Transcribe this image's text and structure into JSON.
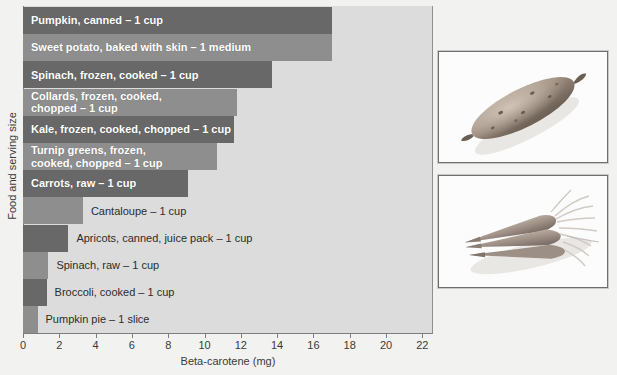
{
  "chart_data": {
    "type": "bar",
    "orientation": "horizontal",
    "title": "",
    "xlabel": "Beta-carotene (mg)",
    "ylabel": "Food and serving size",
    "xlim": [
      0,
      22.5
    ],
    "xticks": [
      0,
      2,
      4,
      6,
      8,
      10,
      12,
      14,
      16,
      18,
      20,
      22
    ],
    "xtick_labels": [
      "0",
      "2",
      "4",
      "6",
      "8",
      "10",
      "12",
      "14",
      "16",
      "18",
      "20",
      "22"
    ],
    "grid": false,
    "legend": false,
    "categories": [
      "Pumpkin, canned – 1 cup",
      "Sweet potato, baked with skin – 1 medium",
      "Spinach, frozen, cooked – 1 cup",
      "Collards, frozen, cooked,\nchopped – 1 cup",
      "Kale, frozen, cooked, chopped – 1 cup",
      "Turnip greens, frozen,\ncooked, chopped – 1 cup",
      "Carrots, raw – 1 cup",
      "Cantaloupe – 1 cup",
      "Apricots, canned, juice pack – 1 cup",
      "Spinach, raw – 1 cup",
      "Broccoli, cooked – 1 cup",
      "Pumpkin pie – 1 slice"
    ],
    "values": [
      17.0,
      17.0,
      13.7,
      11.8,
      11.6,
      10.7,
      9.1,
      3.3,
      2.5,
      1.4,
      1.3,
      0.8
    ],
    "bar_colors": [
      "#686868",
      "#8e8e8e",
      "#686868",
      "#8e8e8e",
      "#686868",
      "#8e8e8e",
      "#686868",
      "#8e8e8e",
      "#686868",
      "#8e8e8e",
      "#686868",
      "#8e8e8e"
    ],
    "label_placement": [
      "inside",
      "inside",
      "inside",
      "inside",
      "inside",
      "inside",
      "inside",
      "outside",
      "outside",
      "outside",
      "outside",
      "outside"
    ],
    "plot_background": "#dcdcdc",
    "page_background": "#f2f2f0"
  },
  "bars": [
    {
      "label": "Pumpkin, canned – 1 cup",
      "value": 17.0,
      "style": "dark",
      "placement": "inside",
      "lines": 1
    },
    {
      "label": "Sweet potato, baked with skin – 1 medium",
      "value": 17.0,
      "style": "mid",
      "placement": "inside",
      "lines": 1
    },
    {
      "label": "Spinach, frozen, cooked – 1 cup",
      "value": 13.7,
      "style": "dark",
      "placement": "inside",
      "lines": 1
    },
    {
      "label": "Collards, frozen, cooked,\nchopped – 1 cup",
      "value": 11.8,
      "style": "mid",
      "placement": "inside",
      "lines": 2
    },
    {
      "label": "Kale, frozen, cooked, chopped – 1 cup",
      "value": 11.6,
      "style": "dark",
      "placement": "inside",
      "lines": 1
    },
    {
      "label": "Turnip greens, frozen,\ncooked, chopped – 1 cup",
      "value": 10.7,
      "style": "mid",
      "placement": "inside",
      "lines": 2
    },
    {
      "label": "Carrots, raw – 1 cup",
      "value": 9.1,
      "style": "dark",
      "placement": "inside",
      "lines": 1
    },
    {
      "label": "Cantaloupe – 1 cup",
      "value": 3.3,
      "style": "mid",
      "placement": "outside",
      "lines": 1
    },
    {
      "label": "Apricots, canned, juice pack – 1 cup",
      "value": 2.5,
      "style": "dark",
      "placement": "outside",
      "lines": 1
    },
    {
      "label": "Spinach, raw – 1 cup",
      "value": 1.4,
      "style": "mid",
      "placement": "outside",
      "lines": 1
    },
    {
      "label": "Broccoli, cooked – 1 cup",
      "value": 1.3,
      "style": "dark",
      "placement": "outside",
      "lines": 1
    },
    {
      "label": "Pumpkin pie – 1 slice",
      "value": 0.8,
      "style": "mid",
      "placement": "outside",
      "lines": 1
    }
  ],
  "axes": {
    "x_title": "Beta-carotene (mg)",
    "y_title": "Food and serving size",
    "x_ticks": [
      "0",
      "2",
      "4",
      "6",
      "8",
      "10",
      "12",
      "14",
      "16",
      "18",
      "20",
      "22"
    ]
  },
  "photos": [
    {
      "name": "sweet-potato-photo",
      "caption": ""
    },
    {
      "name": "carrots-photo",
      "caption": ""
    }
  ]
}
